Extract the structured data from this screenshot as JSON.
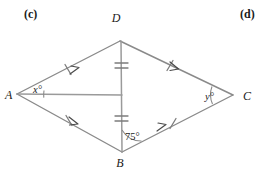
{
  "part_labels": {
    "left": "(c)",
    "right": "(d)"
  },
  "figure": {
    "type": "quadrilateral-with-diagonals",
    "vertices": [
      {
        "name": "D",
        "label": "D",
        "x": 120,
        "y": 41,
        "label_x": 116,
        "label_y": 22
      },
      {
        "name": "A",
        "label": "A",
        "x": 17,
        "y": 94,
        "label_x": 3,
        "label_y": 98
      },
      {
        "name": "C",
        "label": "C",
        "x": 233,
        "y": 95,
        "label_x": 241,
        "label_y": 100
      },
      {
        "name": "B",
        "label": "B",
        "x": 122,
        "y": 152,
        "label_x": 118,
        "label_y": 167
      }
    ],
    "edges": [
      {
        "name": "AD",
        "from": "A",
        "to": "D",
        "ticks": 1,
        "arrows": 1
      },
      {
        "name": "DC",
        "from": "D",
        "to": "C",
        "ticks": 1,
        "arrows": 1
      },
      {
        "name": "AB",
        "from": "A",
        "to": "B",
        "ticks": 1,
        "arrows": 1
      },
      {
        "name": "BC",
        "from": "B",
        "to": "C",
        "ticks": 1,
        "arrows": 1
      }
    ],
    "diagonals": [
      {
        "name": "DB",
        "from": "D",
        "to": "B",
        "ticks": 2
      },
      {
        "name": "A-to-center",
        "from": "A",
        "to": "center",
        "ticks": 0
      }
    ],
    "intersection": {
      "x": 122,
      "y": 95
    },
    "angles": [
      {
        "name": "angle-A",
        "label": "x°",
        "vertex": "A",
        "label_x": 33,
        "label_y": 93
      },
      {
        "name": "angle-C",
        "label": "y°",
        "vertex": "C",
        "label_x": 205,
        "label_y": 100
      },
      {
        "name": "angle-B",
        "label": "75°",
        "vertex": "B",
        "label_x": 125,
        "label_y": 141
      }
    ]
  },
  "colors": {
    "line": "#8a8a8a",
    "text": "#1a1a1a",
    "background": "#ffffff",
    "mark": "#4a4a4a"
  }
}
